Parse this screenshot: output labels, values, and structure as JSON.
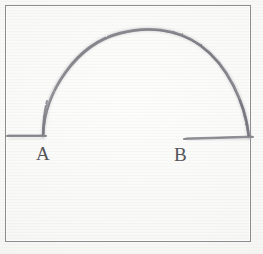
{
  "figure": {
    "medium": "pencil sketch on paper",
    "background_color": "#f8f8f6",
    "stroke_color": "#8a8a90",
    "frame_color": "#8d8d90",
    "label_color": "#55555a",
    "labels": [
      {
        "id": "a",
        "text": "A",
        "x": 36,
        "y": 144
      },
      {
        "id": "b",
        "text": "B",
        "x": 174,
        "y": 145
      }
    ],
    "geometry": {
      "arc": {
        "left_foot": [
          43,
          136
        ],
        "apex": [
          155,
          29
        ],
        "right_foot": [
          249,
          137
        ],
        "baseline_y": 136
      },
      "baseline_segments": [
        {
          "name": "left-baseline",
          "x1": 7,
          "x2": 46,
          "y": 136
        },
        {
          "name": "right-baseline",
          "x1": 184,
          "x2": 253,
          "y": 138
        }
      ],
      "frame": {
        "x": 5,
        "y": 5,
        "width": 246,
        "height": 237
      }
    }
  }
}
